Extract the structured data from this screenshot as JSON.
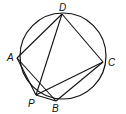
{
  "diagram": {
    "circle": {
      "cx": 63,
      "cy": 56,
      "r": 43
    },
    "points": {
      "D": {
        "x": 62,
        "y": 14,
        "label": "D",
        "lx": 59,
        "ly": 3
      },
      "A": {
        "x": 17,
        "y": 58,
        "label": "A",
        "lx": 7,
        "ly": 53
      },
      "C": {
        "x": 103,
        "y": 62,
        "label": "C",
        "lx": 108,
        "ly": 58
      },
      "P": {
        "x": 36,
        "y": 95,
        "label": "P",
        "lx": 28,
        "ly": 99
      },
      "B": {
        "x": 56,
        "y": 101,
        "label": "B",
        "lx": 52,
        "ly": 104
      }
    },
    "segments": [
      [
        "A",
        "D"
      ],
      [
        "D",
        "C"
      ],
      [
        "C",
        "B"
      ],
      [
        "A",
        "P"
      ],
      [
        "A",
        "B"
      ],
      [
        "P",
        "B"
      ],
      [
        "D",
        "P"
      ],
      [
        "C",
        "P"
      ]
    ],
    "stroke": "#111111"
  }
}
